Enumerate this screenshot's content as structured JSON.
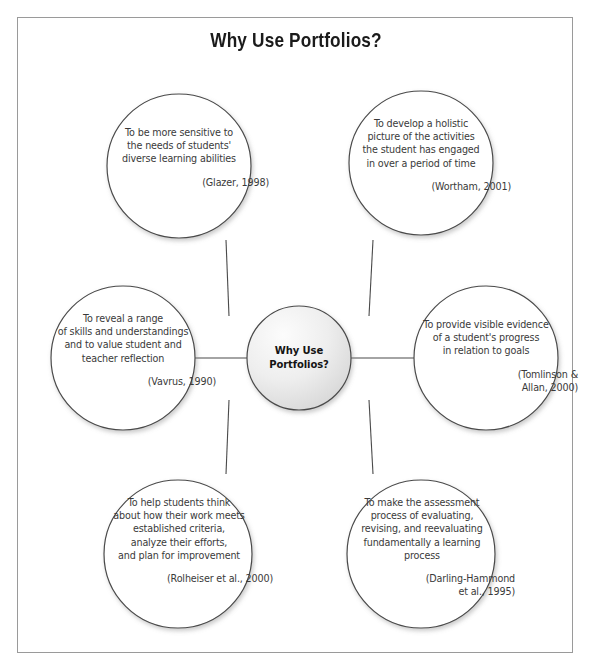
{
  "figure": {
    "title": "Why Use Portfolios?",
    "frame_color": "#9a9a9a",
    "stroke_color": "#4a4a4a",
    "text_color": "#3a3a3a",
    "hub_fill_light": "#fbfbfb",
    "hub_fill_dark": "#dcdcdc"
  },
  "hub": {
    "line1": "Why Use",
    "line2": "Portfolios?"
  },
  "nodes": [
    {
      "id": "sensitive-to-needs",
      "name": "node-sensitive-to-needs",
      "lines": [
        "To be more sensitive to",
        "the needs of students'",
        "diverse learning abilities"
      ],
      "citation_lines": [
        "(Glazer, 1998)"
      ],
      "citation_align": "right"
    },
    {
      "id": "holistic-picture",
      "name": "node-holistic-picture",
      "lines": [
        "To develop a holistic",
        "picture of the activities",
        "the student has engaged",
        "in over a period of time"
      ],
      "citation_lines": [
        "(Wortham, 2001)"
      ],
      "citation_align": "right"
    },
    {
      "id": "reveal-range-of-skills",
      "name": "node-reveal-range-of-skills",
      "lines": [
        "To reveal a range",
        "of skills and understandings",
        "and to value student and",
        "teacher reflection"
      ],
      "citation_lines": [
        "(Vavrus, 1990)"
      ],
      "citation_align": "right"
    },
    {
      "id": "visible-evidence",
      "name": "node-visible-evidence",
      "lines": [
        "To provide visible evidence",
        "of a student's progress",
        "in relation to goals"
      ],
      "citation_lines": [
        "(Tomlinson &",
        "Allan, 2000)"
      ],
      "citation_align": "right"
    },
    {
      "id": "help-students-think",
      "name": "node-help-students-think",
      "lines": [
        "To help students think",
        "about how their work meets",
        "established criteria,",
        "analyze their efforts,",
        "and plan for improvement"
      ],
      "citation_lines": [
        "(Rolheiser et al., 2000)"
      ],
      "citation_align": "right"
    },
    {
      "id": "assessment-process",
      "name": "node-assessment-process",
      "lines": [
        "To make the assessment",
        "process of evaluating,",
        "revising, and reevaluating",
        "fundamentally a learning",
        "process"
      ],
      "citation_lines": [
        "(Darling-Hammond",
        "et al., 1995)"
      ],
      "citation_align": "right"
    }
  ]
}
